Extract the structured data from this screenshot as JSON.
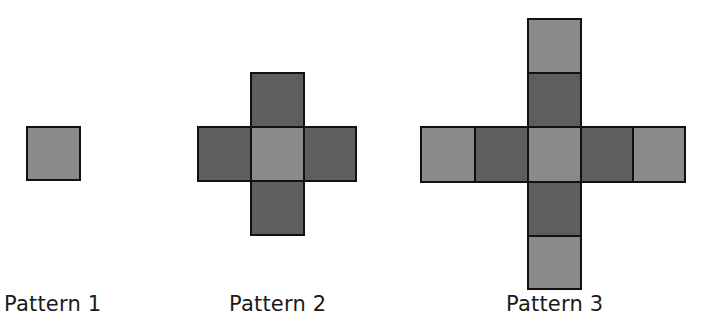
{
  "figure": {
    "colors": {
      "light_square": "#8a8a8a",
      "dark_square": "#5e5e5e",
      "border": "#111111"
    },
    "patterns": [
      {
        "label": "Pattern 1",
        "squares_total": 1,
        "light_squares": 1,
        "dark_squares": 0
      },
      {
        "label": "Pattern 2",
        "squares_total": 5,
        "light_squares": 1,
        "dark_squares": 4
      },
      {
        "label": "Pattern 3",
        "squares_total": 9,
        "light_squares": 5,
        "dark_squares": 4
      }
    ]
  }
}
